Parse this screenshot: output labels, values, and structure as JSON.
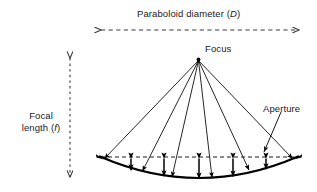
{
  "figure": {
    "background_color": "#ffffff",
    "stroke_color": "#000000",
    "text_color": "#1a1a1a",
    "width": 317,
    "height": 192
  },
  "labels": {
    "diameter": {
      "text": "Paraboloid diameter (",
      "symbol": "D",
      "suffix": ")",
      "full": "Paraboloid diameter (D)"
    },
    "focal_length": {
      "line1": "Focal",
      "line2_prefix": "length (",
      "symbol": "f",
      "line2_suffix": ")",
      "full": "Focal length (f)"
    },
    "focus": {
      "text": "Focus"
    },
    "aperture": {
      "text": "Aperture"
    }
  },
  "geometry": {
    "focus_point": {
      "x": 198.5,
      "y": 59.5
    },
    "dish_left_edge": {
      "x": 100,
      "y": 157
    },
    "dish_right_edge": {
      "x": 298,
      "y": 157
    },
    "dish_vertex": {
      "x": 199,
      "y": 178
    },
    "aperture_line_y": 157,
    "diameter_arrow": {
      "x1": 100,
      "x2": 300,
      "y": 30
    },
    "focal_arrow": {
      "x": 70,
      "y1": 57,
      "y2": 178
    },
    "ray_count": 6,
    "depth_arrow_count": 5
  }
}
